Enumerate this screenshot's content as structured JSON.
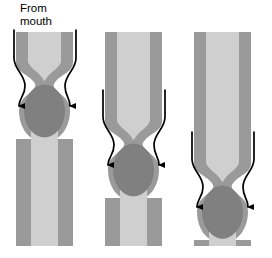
{
  "figure": {
    "annotations": [
      {
        "id": "from-mouth",
        "text": "From\nmouth",
        "x": 20,
        "y": 2
      }
    ],
    "colors": {
      "tube_wall": "#9a9a9a",
      "tube_lumen": "#cfcfcf",
      "bolus": "#808080",
      "outline": "#000000",
      "background": "#ffffff",
      "text": "#000000"
    },
    "stages": [
      {
        "name": "stage-1-upper-esophagus",
        "label": "",
        "tube_left": 16,
        "tube_right": 73,
        "tube_top": 32,
        "tube_bottom": 246,
        "wall_thickness": 12,
        "constriction_center_y": 82,
        "bolus_center_x": 44.5,
        "bolus_center_y": 111,
        "bolus_rx": 20,
        "bolus_ry": 26,
        "arrow_top_y": 30,
        "arrow_tip_y": 110,
        "arrow_left_x": 14,
        "arrow_right_x": 76
      },
      {
        "name": "stage-2-mid-esophagus",
        "label": "",
        "tube_left": 105,
        "tube_right": 162,
        "tube_top": 32,
        "tube_bottom": 246,
        "wall_thickness": 12,
        "constriction_center_y": 140,
        "bolus_center_x": 133.5,
        "bolus_center_y": 170,
        "bolus_rx": 20,
        "bolus_ry": 26,
        "arrow_top_y": 90,
        "arrow_tip_y": 168,
        "arrow_left_x": 103,
        "arrow_right_x": 165
      },
      {
        "name": "stage-3-lower-esophagus",
        "label": "",
        "tube_left": 194,
        "tube_right": 251,
        "tube_top": 32,
        "tube_bottom": 246,
        "wall_thickness": 12,
        "constriction_center_y": 182,
        "bolus_center_x": 222.5,
        "bolus_center_y": 212,
        "bolus_rx": 20,
        "bolus_ry": 26,
        "arrow_top_y": 132,
        "arrow_tip_y": 210,
        "arrow_left_x": 192,
        "arrow_right_x": 254
      }
    ]
  }
}
